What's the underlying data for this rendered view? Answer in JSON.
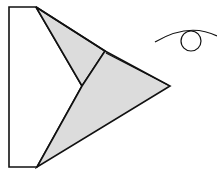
{
  "diagram": {
    "description": "Folded paper airplane / origami flap viewed with an eye symbol indicating viewing direction",
    "colors": {
      "stroke": "#111111",
      "shade": "#dcdcdc",
      "background": "#ffffff"
    },
    "parts": [
      {
        "name": "left-panel",
        "label": "Unfolded left panel"
      },
      {
        "name": "upper-flap",
        "label": "Upper folded flap (shaded)"
      },
      {
        "name": "lower-flap",
        "label": "Lower folded flap (shaded)"
      },
      {
        "name": "eye-icon",
        "label": "Viewing direction eye"
      }
    ]
  }
}
